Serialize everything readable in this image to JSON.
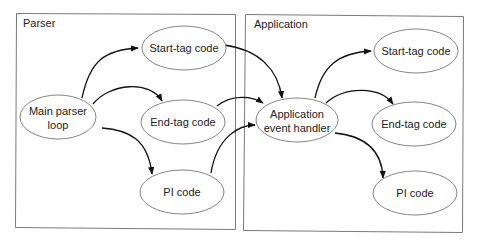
{
  "diagram": {
    "groups": [
      {
        "id": "parser",
        "label": "Parser"
      },
      {
        "id": "application",
        "label": "Application"
      }
    ],
    "nodes": {
      "main_parser_loop": {
        "line1": "Main parser",
        "line2": "loop"
      },
      "parser_start_tag": {
        "label": "Start-tag code"
      },
      "parser_end_tag": {
        "label": "End-tag code"
      },
      "parser_pi": {
        "label": "PI code"
      },
      "app_event_handler": {
        "line1": "Application",
        "line2": "event handler"
      },
      "app_start_tag": {
        "label": "Start-tag code"
      },
      "app_end_tag": {
        "label": "End-tag code"
      },
      "app_pi": {
        "label": "PI code"
      }
    },
    "edges": [
      {
        "from": "Main parser loop",
        "to": "Start-tag code (Parser)"
      },
      {
        "from": "Main parser loop",
        "to": "End-tag code (Parser)"
      },
      {
        "from": "Main parser loop",
        "to": "PI code (Parser)"
      },
      {
        "from": "Start-tag code (Parser)",
        "to": "Application event handler"
      },
      {
        "from": "End-tag code (Parser)",
        "to": "Application event handler"
      },
      {
        "from": "PI code (Parser)",
        "to": "Application event handler"
      },
      {
        "from": "Application event handler",
        "to": "Start-tag code (Application)"
      },
      {
        "from": "Application event handler",
        "to": "End-tag code (Application)"
      },
      {
        "from": "Application event handler",
        "to": "PI code (Application)"
      }
    ]
  }
}
